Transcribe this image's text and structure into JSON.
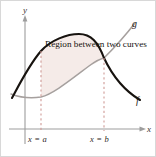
{
  "figure": {
    "caption": "Region between two curves",
    "axes": {
      "y_label": "y",
      "x_label": "x",
      "y_axis_x": 24,
      "x_axis_y": 128,
      "axis_color": "#9a9a9a"
    },
    "curves": [
      {
        "name": "f",
        "label": "f",
        "style": "solid",
        "color": "#1a1613",
        "width": 2.1,
        "shape": "concave-down parabola",
        "points": [
          [
            11,
            97
          ],
          [
            24,
            72
          ],
          [
            40,
            50
          ],
          [
            56,
            38
          ],
          [
            78,
            33
          ],
          [
            96,
            42
          ],
          [
            112,
            60
          ],
          [
            128,
            80
          ],
          [
            140,
            97
          ]
        ]
      },
      {
        "name": "g",
        "label": "g",
        "style": "solid",
        "color": "#a09a98",
        "width": 1.5,
        "shape": "increasing curve",
        "points": [
          [
            10,
            93
          ],
          [
            22,
            96
          ],
          [
            34,
            97
          ],
          [
            46,
            93
          ],
          [
            60,
            85
          ],
          [
            74,
            75
          ],
          [
            88,
            65
          ],
          [
            103,
            57
          ],
          [
            118,
            41
          ],
          [
            134,
            24
          ]
        ]
      }
    ],
    "region": {
      "fill": "#f5ebe8",
      "left_bound_x": 40,
      "right_bound_x": 103
    },
    "boundaries": [
      {
        "name": "lower-limit",
        "label": "x = a",
        "x": 40,
        "dash_color": "#cf9b96"
      },
      {
        "name": "upper-limit",
        "label": "x = b",
        "x": 103,
        "dash_color": "#cf9b96"
      }
    ]
  }
}
